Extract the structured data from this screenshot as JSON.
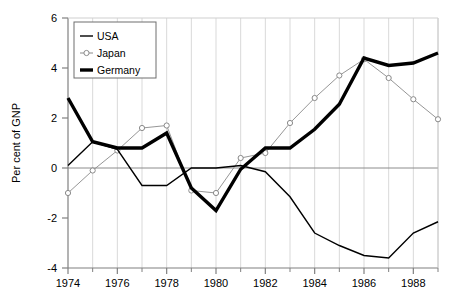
{
  "chart_data": {
    "type": "line",
    "title": "",
    "subtitle": "",
    "xlabel": "",
    "ylabel": "Per cent of GNP",
    "xlim": [
      1974,
      1989
    ],
    "ylim": [
      -4,
      6
    ],
    "ytick_values": [
      -4,
      -2,
      0,
      2,
      4,
      6
    ],
    "ytick_labels": [
      "-4",
      "-2",
      "0",
      "2",
      "4",
      "6"
    ],
    "xtick_values": [
      1974,
      1976,
      1978,
      1980,
      1982,
      1984,
      1986,
      1988
    ],
    "xtick_labels": [
      "1974",
      "1976",
      "1978",
      "1980",
      "1982",
      "1984",
      "1986",
      "1988"
    ],
    "xtick_minor_values": [
      1975,
      1977,
      1979,
      1981,
      1983,
      1985,
      1987,
      1989
    ],
    "grid": true,
    "grid_axis": "x",
    "zero_line": true,
    "legend_position": "upper-left",
    "x": [
      1974,
      1975,
      1976,
      1977,
      1978,
      1979,
      1980,
      1981,
      1982,
      1983,
      1984,
      1985,
      1986,
      1987,
      1988,
      1989
    ],
    "series": [
      {
        "name": "USA",
        "color": "#000000",
        "line_width": 1.4,
        "marker": "none",
        "values": [
          0.1,
          1.05,
          0.75,
          -0.7,
          -0.7,
          0.0,
          0.0,
          0.1,
          -0.15,
          -1.15,
          -2.6,
          -3.1,
          -3.5,
          -3.6,
          -2.6,
          -2.15
        ]
      },
      {
        "name": "Japan",
        "color": "#8a8a8a",
        "line_width": 0.9,
        "marker": "circle",
        "values": [
          -1.0,
          -0.1,
          0.7,
          1.6,
          1.7,
          -0.9,
          -1.0,
          0.4,
          0.6,
          1.8,
          2.8,
          3.7,
          4.35,
          3.6,
          2.75,
          1.95
        ]
      },
      {
        "name": "Germany",
        "color": "#000000",
        "line_width": 3.4,
        "marker": "none",
        "values": [
          2.8,
          1.05,
          0.8,
          0.8,
          1.4,
          -0.8,
          -1.7,
          -0.05,
          0.8,
          0.8,
          1.55,
          2.55,
          4.4,
          4.1,
          4.2,
          4.6
        ]
      }
    ],
    "legend_entries": [
      {
        "label": "USA",
        "style": "thin-line"
      },
      {
        "label": "Japan",
        "style": "thin-line-circle"
      },
      {
        "label": "Germany",
        "style": "thick-line"
      }
    ]
  },
  "colors": {
    "axis": "#808080",
    "grid": "#d9d9d9",
    "zero_line": "#8c8c8c",
    "text": "#000000",
    "background": "#ffffff",
    "usa": "#000000",
    "japan": "#8a8a8a",
    "germany": "#000000",
    "legend_border": "#6e6e6e"
  }
}
